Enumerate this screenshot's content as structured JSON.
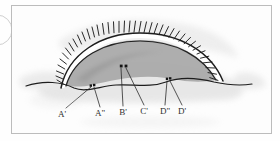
{
  "figure": {
    "kind": "sketch",
    "frame": {
      "border_color": "#b9b9b9",
      "fill_color": "#fdfdfd"
    },
    "background_color": "#fefefe",
    "ink_color": "#1c1c1c",
    "dome_fill_color": "#a9a9a9",
    "dome_rim_color": "#ffffff",
    "wash_color": "#d8d8d8",
    "partial_circle": {
      "name": "clipped-circle-arc",
      "stroke_color": "#c8c8c8"
    },
    "labels": [
      {
        "id": "a-prime",
        "text": "A'",
        "x": 63,
        "y": 116
      },
      {
        "id": "a-double-prime",
        "text": "A\"",
        "x": 98,
        "y": 115
      },
      {
        "id": "b-prime",
        "text": "B'",
        "x": 122,
        "y": 114
      },
      {
        "id": "c-prime",
        "text": "C'",
        "x": 142,
        "y": 113
      },
      {
        "id": "d-double-prime",
        "text": "D\"",
        "x": 162,
        "y": 113
      },
      {
        "id": "d-prime",
        "text": "D'",
        "x": 180,
        "y": 113
      }
    ],
    "marker_points": [
      {
        "id": "point-a-prime",
        "x": 91,
        "y": 86
      },
      {
        "id": "point-a-double-prime",
        "x": 94,
        "y": 85
      },
      {
        "id": "point-b-prime",
        "x": 121,
        "y": 66
      },
      {
        "id": "point-c-prime",
        "x": 126,
        "y": 66
      },
      {
        "id": "point-d-double-prime",
        "x": 167,
        "y": 79
      },
      {
        "id": "point-d-prime",
        "x": 170,
        "y": 79
      }
    ],
    "leader_lines": [
      {
        "id": "leader-a-prime",
        "x1": 91,
        "y1": 87,
        "x2": 66,
        "y2": 108
      },
      {
        "id": "leader-a-double-prime",
        "x1": 94,
        "y1": 87,
        "x2": 100,
        "y2": 107
      },
      {
        "id": "leader-b-prime",
        "x1": 121,
        "y1": 68,
        "x2": 123,
        "y2": 106
      },
      {
        "id": "leader-c-prime",
        "x1": 126,
        "y1": 68,
        "x2": 144,
        "y2": 105
      },
      {
        "id": "leader-d-double-prime",
        "x1": 167,
        "y1": 81,
        "x2": 165,
        "y2": 105
      },
      {
        "id": "leader-d-prime",
        "x1": 170,
        "y1": 81,
        "x2": 182,
        "y2": 105
      }
    ],
    "lash_count": 34
  }
}
